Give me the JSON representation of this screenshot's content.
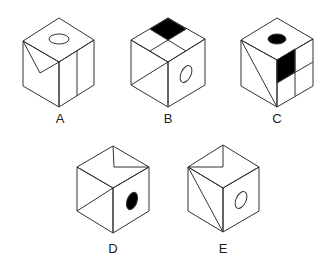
{
  "figure": {
    "options": [
      {
        "label": "A",
        "features": [
          "top: hollow ellipse",
          "left: diagonal V notch from top-left corner",
          "right: vertical line"
        ]
      },
      {
        "label": "B",
        "features": [
          "top: 2x2 grid, back square filled black",
          "left: diagonal line",
          "right: hollow ellipse"
        ]
      },
      {
        "label": "C",
        "features": [
          "top: filled black ellipse",
          "left: diagonal line",
          "right: 2x2 grid, upper-left filled black"
        ]
      },
      {
        "label": "D",
        "features": [
          "top: V notch",
          "left: diagonal line",
          "right: filled black ellipse"
        ]
      },
      {
        "label": "E",
        "features": [
          "top: V notch",
          "left: diagonal line",
          "right: hollow ellipse"
        ]
      }
    ]
  },
  "colors": {
    "stroke": "#333333",
    "fill_black": "#000000",
    "background": "#ffffff"
  }
}
